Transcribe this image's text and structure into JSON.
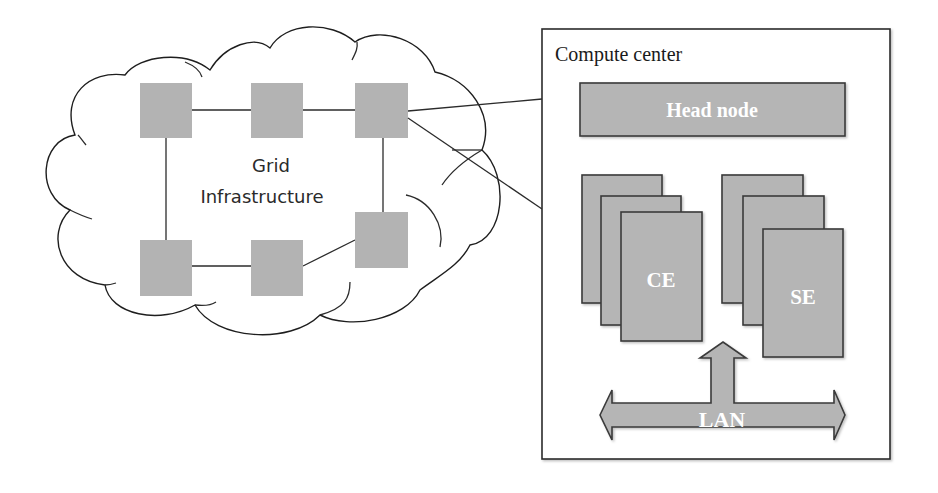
{
  "diagram": {
    "grid": {
      "label_line1": "Grid",
      "label_line2": "Infrastructure",
      "nodes": [
        {
          "id": "n1",
          "x": 140,
          "y": 83,
          "w": 52,
          "h": 55
        },
        {
          "id": "n2",
          "x": 251,
          "y": 83,
          "w": 52,
          "h": 55
        },
        {
          "id": "n3",
          "x": 355,
          "y": 83,
          "w": 53,
          "h": 55
        },
        {
          "id": "n4",
          "x": 140,
          "y": 240,
          "w": 52,
          "h": 56
        },
        {
          "id": "n5",
          "x": 251,
          "y": 240,
          "w": 52,
          "h": 56
        },
        {
          "id": "n6",
          "x": 355,
          "y": 212,
          "w": 53,
          "h": 56
        }
      ]
    },
    "compute_center": {
      "title": "Compute center",
      "head_node": "Head node",
      "ce_label": "CE",
      "se_label": "SE",
      "lan_label": "LAN"
    },
    "colors": {
      "node_fill": "#b3b3b3",
      "box_fill": "#b5b5b5",
      "stroke": "#2b2b2b",
      "text_on_box": "#ffffff"
    }
  }
}
